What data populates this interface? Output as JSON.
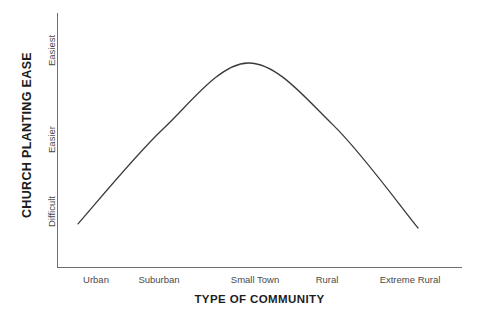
{
  "chart_data": {
    "type": "line",
    "title": "",
    "xlabel": "TYPE OF COMMUNITY",
    "ylabel": "CHURCH PLANTING EASE",
    "categories": [
      "Urban",
      "Suburban",
      "Small Town",
      "Rural",
      "Extreme Rural"
    ],
    "ytick_labels": [
      "Difficult",
      "Easier",
      "Easiest"
    ],
    "ylim": [
      0,
      100
    ],
    "xlim": [
      0,
      4
    ],
    "grid": false,
    "legend": false,
    "series": [
      {
        "name": "Church Planting Ease",
        "values": [
          22,
          68,
          100,
          70,
          20
        ],
        "note": "smooth bell-shaped curve peaking at Small Town"
      }
    ],
    "curve_points": [
      {
        "x": "Urban",
        "y": 22
      },
      {
        "x": "Suburban",
        "y": 68
      },
      {
        "x": "Small Town",
        "y": 100
      },
      {
        "x": "Rural",
        "y": 70
      },
      {
        "x": "Extreme Rural",
        "y": 20
      }
    ],
    "line_color": "#3a3a3a",
    "axis_color": "#6e6e6e",
    "background_color": "#ffffff"
  },
  "axes": {
    "y_title": "CHURCH PLANTING EASE",
    "x_title": "TYPE OF COMMUNITY",
    "y_ticks": [
      {
        "label": "Easiest"
      },
      {
        "label": "Easier"
      },
      {
        "label": "Difficult"
      }
    ],
    "x_ticks": [
      {
        "label": "Urban",
        "left": "96px"
      },
      {
        "label": "Suburban",
        "left": "159px"
      },
      {
        "label": "Small Town",
        "left": "255px"
      },
      {
        "label": "Rural",
        "left": "327px"
      },
      {
        "label": "Extreme Rural",
        "left": "410px"
      }
    ]
  }
}
